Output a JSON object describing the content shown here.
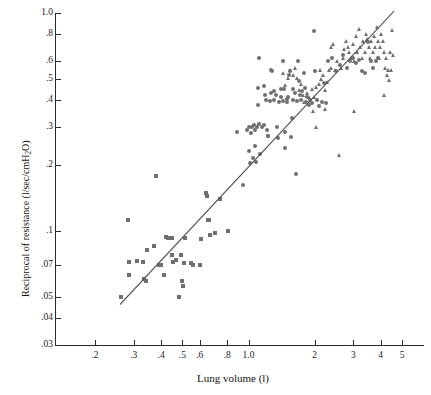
{
  "chart_data": {
    "type": "scatter",
    "title": "",
    "xlabel": "Lung volume (l)",
    "ylabel": "Reciprocal of resistance (l/sec/cmH2O)",
    "ylabel_parts": {
      "pre": "Reciprocal of resistance (l/sec/cmH",
      "sub": "2",
      "post": "O)"
    },
    "xscale": "log",
    "yscale": "log",
    "xlim": [
      0.16,
      6.0
    ],
    "ylim": [
      0.03,
      1.0
    ],
    "grid": false,
    "legend": "none",
    "xticks": [
      ".2",
      ".3",
      ".4",
      ".5",
      ".6",
      ".8",
      "1.0",
      "2",
      "3",
      "4",
      "5"
    ],
    "xtick_values": [
      0.2,
      0.3,
      0.4,
      0.5,
      0.6,
      0.8,
      1.0,
      2,
      3,
      4,
      5
    ],
    "yticks": [
      "1.0",
      ".8",
      ".6",
      ".5",
      ".4",
      ".3",
      ".2",
      ".1",
      ".07",
      ".05",
      ".04",
      ".03"
    ],
    "ytick_values": [
      1.0,
      0.8,
      0.6,
      0.5,
      0.4,
      0.3,
      0.2,
      0.1,
      0.07,
      0.05,
      0.04,
      0.03
    ],
    "marker_color": "#6f6f6f",
    "line_color": "#555555",
    "fit_line": {
      "x": [
        0.26,
        4.6
      ],
      "y": [
        0.046,
        1.02
      ]
    },
    "series": [
      {
        "name": "squares",
        "marker": "square",
        "color": "#6f6f6f",
        "points": [
          [
            0.263,
            0.05
          ],
          [
            0.284,
            0.112
          ],
          [
            0.286,
            0.072
          ],
          [
            0.287,
            0.063
          ],
          [
            0.31,
            0.073
          ],
          [
            0.33,
            0.072
          ],
          [
            0.335,
            0.06
          ],
          [
            0.34,
            0.059
          ],
          [
            0.345,
            0.082
          ],
          [
            0.372,
            0.085
          ],
          [
            0.38,
            0.178
          ],
          [
            0.392,
            0.07
          ],
          [
            0.4,
            0.07
          ],
          [
            0.412,
            0.063
          ],
          [
            0.42,
            0.094
          ],
          [
            0.432,
            0.093
          ],
          [
            0.442,
            0.093
          ],
          [
            0.448,
            0.093
          ],
          [
            0.45,
            0.078
          ],
          [
            0.452,
            0.072
          ],
          [
            0.468,
            0.074
          ],
          [
            0.48,
            0.05
          ],
          [
            0.495,
            0.078
          ],
          [
            0.5,
            0.059
          ],
          [
            0.505,
            0.056
          ],
          [
            0.51,
            0.071
          ],
          [
            0.515,
            0.093
          ],
          [
            0.545,
            0.071
          ],
          [
            0.56,
            0.07
          ],
          [
            0.6,
            0.07
          ],
          [
            0.61,
            0.092
          ],
          [
            0.64,
            0.15
          ],
          [
            0.65,
            0.145
          ],
          [
            0.655,
            0.112
          ],
          [
            0.662,
            0.112
          ],
          [
            0.67,
            0.096
          ],
          [
            0.7,
            0.098
          ],
          [
            0.745,
            0.14
          ],
          [
            0.81,
            0.1
          ]
        ]
      },
      {
        "name": "circles",
        "marker": "circle",
        "color": "#6f6f6f",
        "points": [
          [
            0.89,
            0.285
          ],
          [
            0.94,
            0.162
          ],
          [
            0.98,
            0.29
          ],
          [
            1.0,
            0.3
          ],
          [
            1.01,
            0.232
          ],
          [
            1.02,
            0.205
          ],
          [
            1.03,
            0.282
          ],
          [
            1.04,
            0.3
          ],
          [
            1.05,
            0.216
          ],
          [
            1.06,
            0.305
          ],
          [
            1.07,
            0.29
          ],
          [
            1.075,
            0.245
          ],
          [
            1.08,
            0.208
          ],
          [
            1.09,
            0.3
          ],
          [
            1.1,
            0.38
          ],
          [
            1.105,
            0.455
          ],
          [
            1.11,
            0.622
          ],
          [
            1.12,
            0.31
          ],
          [
            1.13,
            0.225
          ],
          [
            1.15,
            0.3
          ],
          [
            1.17,
            0.305
          ],
          [
            1.18,
            0.465
          ],
          [
            1.19,
            0.42
          ],
          [
            1.2,
            0.4
          ],
          [
            1.21,
            0.29
          ],
          [
            1.22,
            0.274
          ],
          [
            1.23,
            0.272
          ],
          [
            1.25,
            0.395
          ],
          [
            1.26,
            0.43
          ],
          [
            1.27,
            0.55
          ],
          [
            1.28,
            0.545
          ],
          [
            1.3,
            0.398
          ],
          [
            1.31,
            0.44
          ],
          [
            1.33,
            0.422
          ],
          [
            1.35,
            0.3
          ],
          [
            1.36,
            0.268
          ],
          [
            1.38,
            0.392
          ],
          [
            1.4,
            0.41
          ],
          [
            1.41,
            0.448
          ],
          [
            1.43,
            0.395
          ],
          [
            1.44,
            0.6
          ],
          [
            1.45,
            0.448
          ],
          [
            1.46,
            0.285
          ],
          [
            1.47,
            0.24
          ],
          [
            1.49,
            0.402
          ],
          [
            1.5,
            0.39
          ],
          [
            1.51,
            0.412
          ],
          [
            1.53,
            0.52
          ],
          [
            1.55,
            0.545
          ],
          [
            1.56,
            0.27
          ],
          [
            1.57,
            0.33
          ],
          [
            1.59,
            0.4
          ],
          [
            1.6,
            0.45
          ],
          [
            1.62,
            0.43
          ],
          [
            1.64,
            0.182
          ],
          [
            1.66,
            0.395
          ],
          [
            1.68,
            0.6
          ],
          [
            1.7,
            0.488
          ],
          [
            1.72,
            0.42
          ],
          [
            1.74,
            0.398
          ],
          [
            1.76,
            0.44
          ],
          [
            1.78,
            0.53
          ],
          [
            1.8,
            0.455
          ],
          [
            1.82,
            0.39
          ],
          [
            1.85,
            0.41
          ],
          [
            1.88,
            0.378
          ],
          [
            1.9,
            0.4
          ],
          [
            1.95,
            0.385
          ],
          [
            1.98,
            0.83
          ],
          [
            2.0,
            0.545
          ],
          [
            2.05,
            0.398
          ],
          [
            2.1,
            0.375
          ],
          [
            2.15,
            0.39
          ],
          [
            2.2,
            0.48
          ],
          [
            2.25,
            0.388
          ],
          [
            2.3,
            0.6
          ],
          [
            2.4,
            0.62
          ],
          [
            2.5,
            0.545
          ],
          [
            2.6,
            0.578
          ],
          [
            2.7,
            0.64
          ],
          [
            2.8,
            0.56
          ],
          [
            2.9,
            0.6
          ],
          [
            3.0,
            0.62
          ],
          [
            3.1,
            0.59
          ],
          [
            3.2,
            0.61
          ],
          [
            3.3,
            0.545
          ],
          [
            3.4,
            0.53
          ],
          [
            3.5,
            0.74
          ],
          [
            3.6,
            0.6
          ],
          [
            3.7,
            0.56
          ],
          [
            3.8,
            0.6
          ],
          [
            3.9,
            0.62
          ]
        ]
      },
      {
        "name": "triangles",
        "marker": "triangle",
        "color": "#6f6f6f",
        "points": [
          [
            1.45,
            0.53
          ],
          [
            1.48,
            0.465
          ],
          [
            1.52,
            0.5
          ],
          [
            1.56,
            0.545
          ],
          [
            1.6,
            0.52
          ],
          [
            1.64,
            0.56
          ],
          [
            1.68,
            0.5
          ],
          [
            1.7,
            0.44
          ],
          [
            1.74,
            0.47
          ],
          [
            1.78,
            0.42
          ],
          [
            1.8,
            0.39
          ],
          [
            1.85,
            0.43
          ],
          [
            1.9,
            0.41
          ],
          [
            1.95,
            0.445
          ],
          [
            2.0,
            0.41
          ],
          [
            2.05,
            0.455
          ],
          [
            2.1,
            0.47
          ],
          [
            2.15,
            0.498
          ],
          [
            2.2,
            0.52
          ],
          [
            2.25,
            0.44
          ],
          [
            2.3,
            0.48
          ],
          [
            2.35,
            0.545
          ],
          [
            2.4,
            0.7
          ],
          [
            2.45,
            0.72
          ],
          [
            2.5,
            0.545
          ],
          [
            2.55,
            0.6
          ],
          [
            2.6,
            0.222
          ],
          [
            2.65,
            0.56
          ],
          [
            2.7,
            0.62
          ],
          [
            2.75,
            0.68
          ],
          [
            2.8,
            0.74
          ],
          [
            2.85,
            0.7
          ],
          [
            2.9,
            0.66
          ],
          [
            2.95,
            0.62
          ],
          [
            3.0,
            0.72
          ],
          [
            3.05,
            0.6
          ],
          [
            3.1,
            0.78
          ],
          [
            3.15,
            0.66
          ],
          [
            3.2,
            0.84
          ],
          [
            3.25,
            0.7
          ],
          [
            3.3,
            0.62
          ],
          [
            3.35,
            0.74
          ],
          [
            3.4,
            0.66
          ],
          [
            3.45,
            0.8
          ],
          [
            3.5,
            0.76
          ],
          [
            3.55,
            0.7
          ],
          [
            3.6,
            0.62
          ],
          [
            3.65,
            0.74
          ],
          [
            3.7,
            0.66
          ],
          [
            3.75,
            0.78
          ],
          [
            3.8,
            0.7
          ],
          [
            3.85,
            0.86
          ],
          [
            3.9,
            0.74
          ],
          [
            3.95,
            0.62
          ],
          [
            4.0,
            0.7
          ],
          [
            4.05,
            0.8
          ],
          [
            4.1,
            0.745
          ],
          [
            4.15,
            0.66
          ],
          [
            4.2,
            0.56
          ],
          [
            4.25,
            0.62
          ],
          [
            4.3,
            0.52
          ],
          [
            4.35,
            0.545
          ],
          [
            4.4,
            0.49
          ],
          [
            4.45,
            0.66
          ],
          [
            4.5,
            0.545
          ],
          [
            4.55,
            0.83
          ],
          [
            4.6,
            0.64
          ],
          [
            2.38,
            0.56
          ],
          [
            2.12,
            0.545
          ],
          [
            1.98,
            0.355
          ],
          [
            2.05,
            0.3
          ],
          [
            2.25,
            0.36
          ],
          [
            3.05,
            0.355
          ],
          [
            4.15,
            0.42
          ]
        ]
      }
    ]
  }
}
